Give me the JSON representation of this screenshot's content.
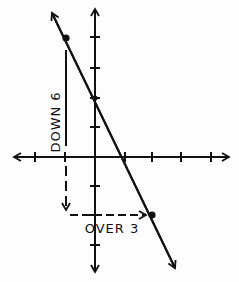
{
  "diagram": {
    "title": "",
    "type": "slope-on-coordinate-plane",
    "labels": {
      "vertical_run": "DOWN 6",
      "horizontal_run": "OVER 3"
    },
    "axes": {
      "origin_px": [
        95,
        157
      ],
      "tick_spacing_px": 30,
      "x_ticks": [
        -3,
        -2,
        -1,
        1,
        2,
        3,
        4,
        5
      ],
      "y_ticks": [
        4,
        3,
        2,
        1,
        -1,
        -2,
        -3
      ]
    },
    "line": {
      "description": "line with negative slope",
      "slope": -2,
      "points": [
        {
          "name": "start-point",
          "x": -1,
          "y": 4
        },
        {
          "name": "y-intercept",
          "x": 0,
          "y": 2
        },
        {
          "name": "end-point",
          "x": 2,
          "y": -2
        }
      ]
    },
    "colors": {
      "ink": "#111111",
      "paper": "#fdfdfd"
    }
  }
}
